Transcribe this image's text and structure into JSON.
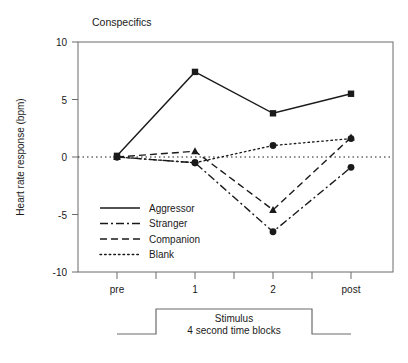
{
  "chart_data": {
    "type": "line",
    "title": "Conspecifics",
    "xlabel": "",
    "ylabel": "Heart rate response (bpm)",
    "categories": [
      "pre",
      "1",
      "2",
      "post"
    ],
    "xtick_labels": [
      "pre",
      "1",
      "2",
      "post"
    ],
    "ytick_labels": [
      "10",
      "5",
      "0",
      "-5",
      "-10"
    ],
    "ylim": [
      -10,
      10
    ],
    "yticks": [
      10,
      5,
      0,
      -5,
      -10
    ],
    "grid": false,
    "zero_reference_line": true,
    "legend_position": "lower-left-inside",
    "series": [
      {
        "name": "Aggressor",
        "linestyle": "solid",
        "marker": "square",
        "values": [
          0.1,
          7.4,
          3.8,
          5.5
        ]
      },
      {
        "name": "Stranger",
        "linestyle": "dash-dot",
        "marker": "circle",
        "values": [
          0.0,
          -0.5,
          -6.5,
          -0.9
        ]
      },
      {
        "name": "Companion",
        "linestyle": "dashed",
        "marker": "triangle",
        "values": [
          0.0,
          0.5,
          -4.6,
          1.7
        ]
      },
      {
        "name": "Blank",
        "linestyle": "dotted",
        "marker": "circle",
        "values": [
          0.0,
          -0.5,
          1.0,
          1.6
        ]
      }
    ],
    "annotations": {
      "stimulus_bar_label_line1": "Stimulus",
      "stimulus_bar_label_line2": "4 second time blocks"
    }
  },
  "colors": {
    "ink": "#1a1a1a",
    "axis": "#5a5a5a",
    "background": "#ffffff"
  }
}
